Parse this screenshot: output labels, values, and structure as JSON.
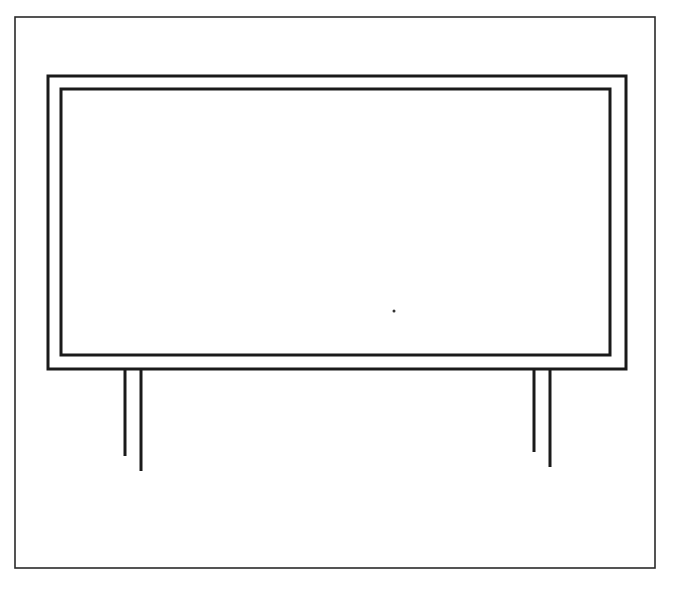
{
  "figure": {
    "title": "",
    "background": "#ffffff",
    "stroke_color": "#1a1a1a",
    "page_frame": {
      "x1": 15,
      "y1": 17,
      "x2": 655,
      "y2": 568,
      "stroke_width": 1.6
    },
    "billboard_outer": {
      "x1": 48,
      "y1": 76,
      "x2": 626,
      "y2": 369,
      "stroke_width": 3
    },
    "billboard_inner": {
      "x1": 61,
      "y1": 89,
      "x2": 610,
      "y2": 355,
      "stroke_width": 3
    },
    "legs": [
      {
        "name": "left-leg-front",
        "x": 125,
        "y1": 369,
        "y2": 456
      },
      {
        "name": "left-leg-back",
        "x": 141,
        "y1": 369,
        "y2": 471
      },
      {
        "name": "right-leg-front",
        "x": 534,
        "y1": 369,
        "y2": 452
      },
      {
        "name": "right-leg-back",
        "x": 550,
        "y1": 369,
        "y2": 467
      }
    ],
    "dot": {
      "x": 394,
      "y": 311,
      "r": 1.5
    }
  }
}
